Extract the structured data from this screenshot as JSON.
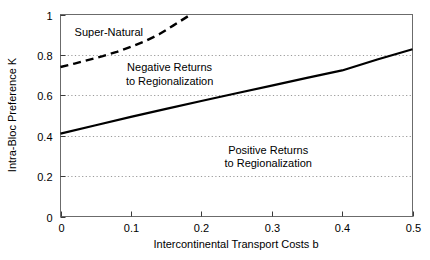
{
  "chart_data": {
    "type": "line",
    "title": "",
    "xlabel": "Intercontinental Transport Costs b",
    "ylabel": "Intra-Bloc Preference K",
    "xlim": [
      0,
      0.5
    ],
    "ylim": [
      0,
      1
    ],
    "grid": "horizontal-dotted",
    "legend": "none",
    "xticks": [
      "0",
      "0.1",
      "0.2",
      "0.3",
      "0.4",
      "0.5"
    ],
    "xtick_values": [
      0,
      0.1,
      0.2,
      0.3,
      0.4,
      0.5
    ],
    "yticks": [
      "0",
      "0.2",
      "0.4",
      "0.6",
      "0.8",
      "1"
    ],
    "ytick_values": [
      0,
      0.2,
      0.4,
      0.6,
      0.8,
      1
    ],
    "gridline_values": [
      0.2,
      0.4,
      0.6,
      0.8
    ],
    "series": [
      {
        "name": "Super-Natural boundary",
        "style": "dashed",
        "color": "#000000",
        "x": [
          0.0,
          0.02,
          0.04,
          0.06,
          0.08,
          0.1,
          0.12,
          0.14,
          0.16,
          0.185
        ],
        "values": [
          0.74,
          0.757,
          0.775,
          0.794,
          0.815,
          0.84,
          0.868,
          0.902,
          0.945,
          1.0
        ]
      },
      {
        "name": "Returns to regionalization boundary",
        "style": "solid",
        "color": "#000000",
        "x": [
          0.0,
          0.05,
          0.1,
          0.15,
          0.2,
          0.25,
          0.3,
          0.35,
          0.4,
          0.45,
          0.5
        ],
        "values": [
          0.41,
          0.452,
          0.493,
          0.533,
          0.572,
          0.61,
          0.648,
          0.686,
          0.723,
          0.777,
          0.828
        ]
      }
    ],
    "annotations": [
      {
        "name": "super-natural",
        "text": "Super-Natural",
        "x": 0.02,
        "y": 0.915
      },
      {
        "name": "negative-returns-line1",
        "text": "Negative Returns",
        "x": 0.155,
        "y": 0.74
      },
      {
        "name": "negative-returns-line2",
        "text": "to Regionalization",
        "x": 0.155,
        "y": 0.672
      },
      {
        "name": "positive-returns-line1",
        "text": "Positive Returns",
        "x": 0.295,
        "y": 0.33
      },
      {
        "name": "positive-returns-line2",
        "text": "to Regionalization",
        "x": 0.295,
        "y": 0.263
      }
    ]
  }
}
